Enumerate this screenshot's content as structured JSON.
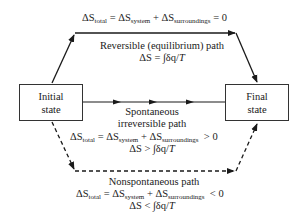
{
  "diagram": {
    "nodes": {
      "initial": {
        "line1": "Initial",
        "line2": "state"
      },
      "final": {
        "line1": "Final",
        "line2": "state"
      }
    },
    "paths": {
      "reversible": {
        "equation": {
          "delta": "ΔS",
          "sub_total": "total",
          "eq": " = ",
          "sub_system": "system",
          "plus": " + ",
          "sub_surr": "surroundings",
          "rel": " = 0"
        },
        "label": "Reversible (equilibrium) path",
        "entropy": {
          "lhs": "ΔS",
          "rel": " = ∫δq/",
          "T": "T"
        },
        "style": "solid"
      },
      "spontaneous": {
        "label_line1": "Spontaneous",
        "label_line2": "irreversible path",
        "equation": {
          "delta": "ΔS",
          "sub_total": "total",
          "eq": " = ",
          "sub_system": "system",
          "plus": " + ",
          "sub_surr": "surroundings",
          "rel": "  > 0"
        },
        "entropy": {
          "lhs": "ΔS",
          "rel": " > ∫δq/",
          "T": "T"
        },
        "style": "solid"
      },
      "nonspontaneous": {
        "label": "Nonspontaneous path",
        "equation": {
          "delta": "ΔS",
          "sub_total": "total",
          "eq": " = ",
          "sub_system": "system",
          "plus": " + ",
          "sub_surr": "surroundings",
          "rel": "  < 0"
        },
        "entropy": {
          "lhs": "ΔS",
          "rel": " < ∫δq/",
          "T": "T"
        },
        "style": "dashed"
      }
    },
    "colors": {
      "line": "#1a1a1a",
      "background": "#ffffff"
    }
  }
}
